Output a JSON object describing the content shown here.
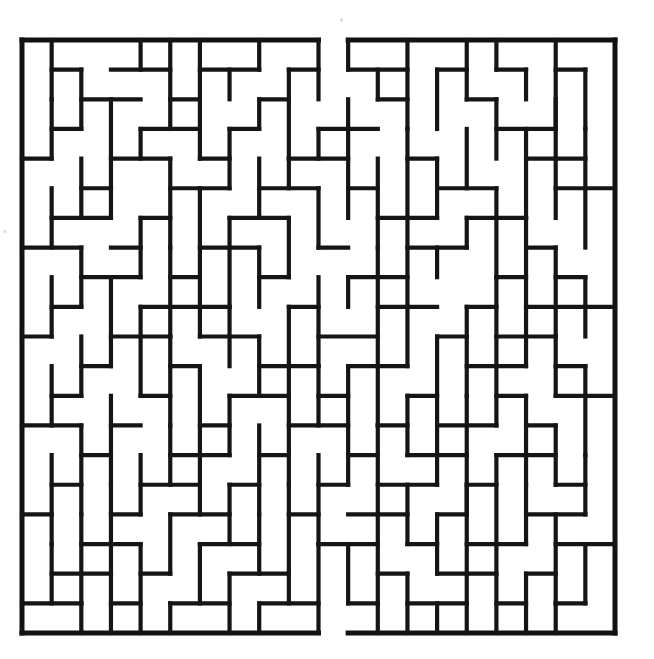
{
  "document": {
    "kind": "maze-puzzle",
    "title": "",
    "background_color": "#ffffff",
    "ink_color": "#151515",
    "scan_artifact_text": "",
    "page_width": 654,
    "page_height": 659
  },
  "maze": {
    "label": "rectangular-grid-maze",
    "cols": 20,
    "rows": 20,
    "origin_x": 22,
    "origin_y": 40,
    "cell_size": 29.65,
    "wall_thickness": 4.2,
    "border_thickness": 5.0,
    "wall_color": "#151515",
    "entrance": {
      "side": "top",
      "col": 10,
      "label": "entrance-gap-top"
    },
    "exit": {
      "side": "bottom",
      "col": 10,
      "label": "exit-gap-bottom"
    },
    "border_segments": [
      {
        "name": "border-top-left",
        "x1": 0,
        "y1": 0,
        "x2": 10,
        "y2": 0
      },
      {
        "name": "border-top-right",
        "x1": 11,
        "y1": 0,
        "x2": 20,
        "y2": 0
      },
      {
        "name": "border-left",
        "x1": 0,
        "y1": 0,
        "x2": 0,
        "y2": 20
      },
      {
        "name": "border-right",
        "x1": 20,
        "y1": 0,
        "x2": 20,
        "y2": 20
      },
      {
        "name": "border-bottom-left",
        "x1": 0,
        "y1": 20,
        "x2": 10,
        "y2": 20
      },
      {
        "name": "border-bottom-right",
        "x1": 11,
        "y1": 20,
        "x2": 20,
        "y2": 20
      }
    ],
    "h_walls": [
      [
        1,
        1,
        2
      ],
      [
        3,
        1,
        5
      ],
      [
        6,
        1,
        8
      ],
      [
        9,
        1,
        10
      ],
      [
        11,
        1,
        13
      ],
      [
        14,
        1,
        15
      ],
      [
        16,
        1,
        17
      ],
      [
        18,
        1,
        19
      ],
      [
        2,
        2,
        4
      ],
      [
        5,
        2,
        6
      ],
      [
        8,
        2,
        9
      ],
      [
        12,
        2,
        13
      ],
      [
        15,
        2,
        16
      ],
      [
        1,
        3,
        2
      ],
      [
        4,
        3,
        6
      ],
      [
        7,
        3,
        8
      ],
      [
        10,
        3,
        12
      ],
      [
        16,
        3,
        18
      ],
      [
        0,
        4,
        1
      ],
      [
        3,
        4,
        5
      ],
      [
        6,
        4,
        7
      ],
      [
        9,
        4,
        11
      ],
      [
        13,
        4,
        14
      ],
      [
        17,
        4,
        19
      ],
      [
        2,
        5,
        3
      ],
      [
        5,
        5,
        7
      ],
      [
        8,
        5,
        10
      ],
      [
        11,
        5,
        12
      ],
      [
        14,
        5,
        16
      ],
      [
        18,
        5,
        20
      ],
      [
        1,
        6,
        3
      ],
      [
        4,
        6,
        5
      ],
      [
        7,
        6,
        9
      ],
      [
        12,
        6,
        14
      ],
      [
        15,
        6,
        17
      ],
      [
        0,
        7,
        2
      ],
      [
        3,
        7,
        4
      ],
      [
        6,
        7,
        8
      ],
      [
        10,
        7,
        11
      ],
      [
        13,
        7,
        15
      ],
      [
        17,
        7,
        18
      ],
      [
        2,
        8,
        4
      ],
      [
        5,
        8,
        6
      ],
      [
        8,
        8,
        9
      ],
      [
        11,
        8,
        13
      ],
      [
        16,
        8,
        17
      ],
      [
        18,
        8,
        19
      ],
      [
        1,
        9,
        2
      ],
      [
        4,
        9,
        7
      ],
      [
        9,
        9,
        10
      ],
      [
        12,
        9,
        14
      ],
      [
        15,
        9,
        16
      ],
      [
        17,
        9,
        20
      ],
      [
        0,
        10,
        1
      ],
      [
        3,
        10,
        5
      ],
      [
        6,
        10,
        8
      ],
      [
        10,
        10,
        12
      ],
      [
        14,
        10,
        15
      ],
      [
        16,
        10,
        18
      ],
      [
        2,
        11,
        3
      ],
      [
        5,
        11,
        6
      ],
      [
        8,
        11,
        10
      ],
      [
        11,
        11,
        13
      ],
      [
        15,
        11,
        17
      ],
      [
        18,
        11,
        19
      ],
      [
        1,
        12,
        2
      ],
      [
        4,
        12,
        5
      ],
      [
        7,
        12,
        9
      ],
      [
        10,
        12,
        11
      ],
      [
        13,
        12,
        14
      ],
      [
        16,
        12,
        17
      ],
      [
        18,
        12,
        20
      ],
      [
        0,
        13,
        2
      ],
      [
        3,
        13,
        4
      ],
      [
        6,
        13,
        7
      ],
      [
        9,
        13,
        11
      ],
      [
        12,
        13,
        13
      ],
      [
        14,
        13,
        16
      ],
      [
        17,
        13,
        18
      ],
      [
        2,
        14,
        3
      ],
      [
        5,
        14,
        7
      ],
      [
        8,
        14,
        9
      ],
      [
        11,
        14,
        12
      ],
      [
        13,
        14,
        15
      ],
      [
        16,
        14,
        18
      ],
      [
        1,
        15,
        2
      ],
      [
        4,
        15,
        6
      ],
      [
        7,
        15,
        8
      ],
      [
        10,
        15,
        11
      ],
      [
        12,
        15,
        14
      ],
      [
        15,
        15,
        16
      ],
      [
        18,
        15,
        19
      ],
      [
        0,
        16,
        1
      ],
      [
        3,
        16,
        4
      ],
      [
        5,
        16,
        7
      ],
      [
        9,
        16,
        10
      ],
      [
        11,
        16,
        13
      ],
      [
        14,
        16,
        15
      ],
      [
        17,
        16,
        19
      ],
      [
        2,
        17,
        4
      ],
      [
        6,
        17,
        8
      ],
      [
        10,
        17,
        12
      ],
      [
        13,
        17,
        14
      ],
      [
        15,
        17,
        17
      ],
      [
        18,
        17,
        20
      ],
      [
        1,
        18,
        3
      ],
      [
        4,
        18,
        5
      ],
      [
        7,
        18,
        9
      ],
      [
        12,
        18,
        13
      ],
      [
        14,
        18,
        16
      ],
      [
        17,
        18,
        18
      ],
      [
        0,
        19,
        2
      ],
      [
        3,
        19,
        4
      ],
      [
        5,
        19,
        7
      ],
      [
        8,
        19,
        10
      ],
      [
        11,
        19,
        12
      ],
      [
        13,
        19,
        15
      ],
      [
        16,
        19,
        17
      ],
      [
        18,
        19,
        19
      ]
    ],
    "v_walls": [
      [
        1,
        0,
        2
      ],
      [
        4,
        0,
        1
      ],
      [
        5,
        0,
        3
      ],
      [
        6,
        0,
        2
      ],
      [
        8,
        0,
        1
      ],
      [
        10,
        0,
        2
      ],
      [
        11,
        0,
        1
      ],
      [
        13,
        0,
        3
      ],
      [
        15,
        0,
        2
      ],
      [
        16,
        0,
        1
      ],
      [
        18,
        0,
        4
      ],
      [
        2,
        1,
        3
      ],
      [
        7,
        1,
        2
      ],
      [
        9,
        1,
        4
      ],
      [
        12,
        1,
        2
      ],
      [
        14,
        1,
        3
      ],
      [
        17,
        1,
        2
      ],
      [
        19,
        1,
        3
      ],
      [
        1,
        2,
        4
      ],
      [
        3,
        2,
        5
      ],
      [
        6,
        2,
        4
      ],
      [
        8,
        2,
        3
      ],
      [
        11,
        2,
        5
      ],
      [
        16,
        2,
        4
      ],
      [
        18,
        2,
        3
      ],
      [
        4,
        3,
        4
      ],
      [
        7,
        3,
        5
      ],
      [
        10,
        3,
        4
      ],
      [
        13,
        3,
        6
      ],
      [
        15,
        3,
        5
      ],
      [
        17,
        3,
        6
      ],
      [
        19,
        3,
        5
      ],
      [
        2,
        4,
        6
      ],
      [
        5,
        4,
        7
      ],
      [
        8,
        4,
        6
      ],
      [
        9,
        4,
        5
      ],
      [
        12,
        4,
        7
      ],
      [
        14,
        4,
        6
      ],
      [
        18,
        4,
        6
      ],
      [
        1,
        5,
        7
      ],
      [
        3,
        5,
        6
      ],
      [
        6,
        5,
        8
      ],
      [
        10,
        5,
        7
      ],
      [
        11,
        5,
        6
      ],
      [
        16,
        5,
        8
      ],
      [
        19,
        5,
        7
      ],
      [
        4,
        6,
        8
      ],
      [
        7,
        6,
        9
      ],
      [
        9,
        6,
        8
      ],
      [
        13,
        6,
        9
      ],
      [
        15,
        6,
        7
      ],
      [
        17,
        6,
        9
      ],
      [
        2,
        7,
        9
      ],
      [
        5,
        7,
        10
      ],
      [
        8,
        7,
        9
      ],
      [
        12,
        7,
        10
      ],
      [
        14,
        7,
        8
      ],
      [
        18,
        7,
        10
      ],
      [
        1,
        8,
        10
      ],
      [
        3,
        8,
        11
      ],
      [
        6,
        8,
        10
      ],
      [
        10,
        8,
        11
      ],
      [
        11,
        8,
        9
      ],
      [
        16,
        8,
        11
      ],
      [
        19,
        8,
        10
      ],
      [
        4,
        9,
        12
      ],
      [
        7,
        9,
        11
      ],
      [
        9,
        9,
        12
      ],
      [
        13,
        9,
        11
      ],
      [
        15,
        9,
        12
      ],
      [
        17,
        9,
        11
      ],
      [
        2,
        10,
        12
      ],
      [
        5,
        10,
        13
      ],
      [
        8,
        10,
        12
      ],
      [
        12,
        10,
        13
      ],
      [
        14,
        10,
        13
      ],
      [
        18,
        10,
        12
      ],
      [
        1,
        11,
        13
      ],
      [
        6,
        11,
        14
      ],
      [
        10,
        11,
        13
      ],
      [
        11,
        11,
        14
      ],
      [
        16,
        11,
        13
      ],
      [
        19,
        11,
        14
      ],
      [
        3,
        12,
        15
      ],
      [
        7,
        12,
        14
      ],
      [
        9,
        12,
        15
      ],
      [
        13,
        12,
        14
      ],
      [
        15,
        12,
        16
      ],
      [
        17,
        12,
        15
      ],
      [
        2,
        13,
        16
      ],
      [
        5,
        13,
        15
      ],
      [
        8,
        13,
        16
      ],
      [
        12,
        13,
        16
      ],
      [
        14,
        13,
        15
      ],
      [
        18,
        13,
        15
      ],
      [
        1,
        14,
        17
      ],
      [
        4,
        14,
        16
      ],
      [
        6,
        14,
        16
      ],
      [
        10,
        14,
        17
      ],
      [
        11,
        14,
        15
      ],
      [
        16,
        14,
        17
      ],
      [
        19,
        14,
        16
      ],
      [
        3,
        15,
        18
      ],
      [
        7,
        15,
        17
      ],
      [
        9,
        15,
        18
      ],
      [
        13,
        15,
        17
      ],
      [
        15,
        15,
        18
      ],
      [
        17,
        15,
        17
      ],
      [
        2,
        16,
        19
      ],
      [
        5,
        16,
        18
      ],
      [
        8,
        16,
        18
      ],
      [
        12,
        16,
        19
      ],
      [
        14,
        16,
        18
      ],
      [
        18,
        16,
        19
      ],
      [
        1,
        17,
        19
      ],
      [
        4,
        17,
        20
      ],
      [
        6,
        17,
        19
      ],
      [
        10,
        17,
        20
      ],
      [
        11,
        17,
        19
      ],
      [
        16,
        17,
        20
      ],
      [
        19,
        17,
        19
      ],
      [
        3,
        18,
        20
      ],
      [
        7,
        18,
        20
      ],
      [
        9,
        18,
        19
      ],
      [
        13,
        18,
        20
      ],
      [
        15,
        18,
        20
      ],
      [
        17,
        18,
        20
      ],
      [
        2,
        19,
        20
      ],
      [
        5,
        19,
        20
      ],
      [
        8,
        19,
        20
      ],
      [
        12,
        19,
        20
      ],
      [
        14,
        19,
        20
      ],
      [
        18,
        19,
        20
      ]
    ]
  }
}
